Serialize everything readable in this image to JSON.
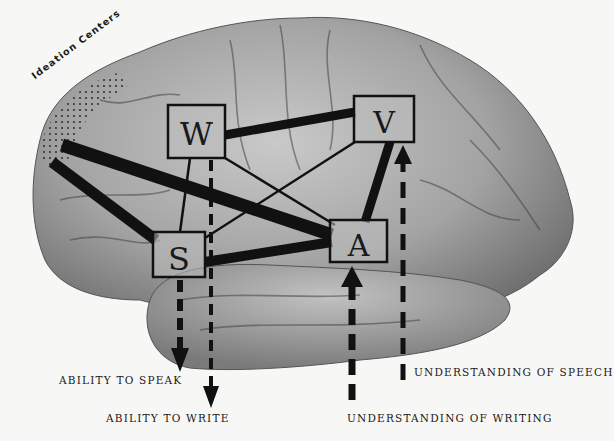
{
  "diagram": {
    "title_region": "Ideation Centers",
    "centers": [
      {
        "id": "W",
        "letter": "W",
        "meaning": "writing center"
      },
      {
        "id": "V",
        "letter": "V",
        "meaning": "visual center"
      },
      {
        "id": "S",
        "letter": "S",
        "meaning": "speech center"
      },
      {
        "id": "A",
        "letter": "A",
        "meaning": "auditory center"
      }
    ],
    "connections": [
      {
        "from": "Ideation",
        "to": "A",
        "weight": "thick"
      },
      {
        "from": "Ideation",
        "to": "S",
        "weight": "thick"
      },
      {
        "from": "W",
        "to": "V",
        "weight": "thick"
      },
      {
        "from": "S",
        "to": "A",
        "weight": "thick"
      },
      {
        "from": "A",
        "to": "V",
        "weight": "thick"
      },
      {
        "from": "W",
        "to": "A",
        "weight": "thin"
      },
      {
        "from": "V",
        "to": "S",
        "weight": "thin"
      },
      {
        "from": "W",
        "to": "S",
        "weight": "thin"
      }
    ],
    "outputs": [
      {
        "from": "S",
        "direction": "down",
        "label": "ABILITY TO SPEAK"
      },
      {
        "from": "W",
        "direction": "down",
        "label": "ABILITY TO WRITE"
      }
    ],
    "inputs": [
      {
        "to": "A",
        "direction": "up",
        "label": "UNDERSTANDING OF WRITING"
      },
      {
        "to": "V",
        "direction": "up",
        "label": "UNDERSTANDING OF SPEECH"
      }
    ]
  },
  "labels": {
    "ideation": "Ideation Centers",
    "speak": "ABILITY TO SPEAK",
    "write": "ABILITY TO WRITE",
    "speech": "UNDERSTANDING OF SPEECH",
    "writing": "UNDERSTANDING OF WRITING"
  },
  "colors": {
    "background": "#f7f7f5",
    "brain": "#9a9a9a",
    "ink": "#111111"
  }
}
